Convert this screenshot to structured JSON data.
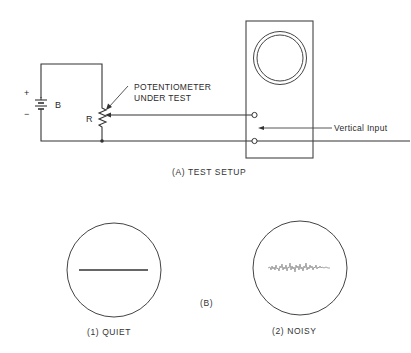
{
  "figure": {
    "part_a": {
      "caption": "(A) TEST SETUP",
      "battery": {
        "label": "B",
        "plus_sign": "+",
        "minus_sign": "−"
      },
      "potentiometer": {
        "label": "R",
        "annotation_line1": "POTENTIOMETER",
        "annotation_line2": "UNDER TEST"
      },
      "oscilloscope": {
        "input_label": "Vertical Input"
      }
    },
    "part_b": {
      "label": "(B)",
      "traces": [
        {
          "caption": "(1) QUIET",
          "kind": "flat-line"
        },
        {
          "caption": "(2) NOISY",
          "kind": "noisy-line"
        }
      ]
    }
  },
  "colors": {
    "ink": "#333333",
    "noise_trace": "#9a9a9a",
    "background": "#ffffff"
  }
}
